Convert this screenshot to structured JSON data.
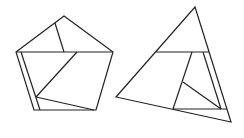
{
  "figure": {
    "width": 244,
    "height": 138,
    "stroke_color": "#222222",
    "background": "#ffffff"
  },
  "shapes": {
    "pentagon": {
      "outline": "64,16 113,52 96,110 34,110 16,52",
      "segments": [
        {
          "x1": 16,
          "y1": 52,
          "x2": 113,
          "y2": 52
        },
        {
          "x1": 55,
          "y1": 23,
          "x2": 64,
          "y2": 52
        },
        {
          "x1": 77,
          "y1": 52,
          "x2": 36,
          "y2": 97
        },
        {
          "x1": 36,
          "y1": 97,
          "x2": 94,
          "y2": 110
        },
        {
          "x1": 21,
          "y1": 52,
          "x2": 40,
          "y2": 110
        }
      ]
    },
    "triangle": {
      "outline": "195,7 231,122 116,97",
      "segments": [
        {
          "x1": 156,
          "y1": 52,
          "x2": 209,
          "y2": 52
        },
        {
          "x1": 192,
          "y1": 52,
          "x2": 173,
          "y2": 109
        },
        {
          "x1": 203,
          "y1": 52,
          "x2": 221,
          "y2": 109
        },
        {
          "x1": 183,
          "y1": 82,
          "x2": 221,
          "y2": 109
        },
        {
          "x1": 173,
          "y1": 109,
          "x2": 227,
          "y2": 109
        }
      ]
    }
  }
}
